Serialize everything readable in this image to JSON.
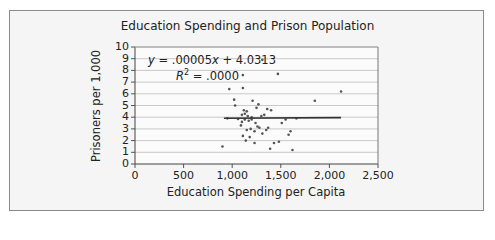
{
  "chart_data": {
    "type": "scatter",
    "title": "Education Spending and Prison Population",
    "xlabel": "Education Spending per Capita",
    "ylabel": "Prisoners per 1,000",
    "xlim": [
      0,
      2500
    ],
    "ylim": [
      0,
      10
    ],
    "x_ticks": [
      "0",
      "500",
      "1,000",
      "1,500",
      "2,000",
      "2,500"
    ],
    "y_ticks": [
      "0",
      "1",
      "2",
      "3",
      "4",
      "5",
      "6",
      "7",
      "8",
      "9",
      "10"
    ],
    "grid": "horizontal",
    "legend": "none",
    "trendline": {
      "equation": "y = .00005x + 4.0313",
      "r_squared": "R² = .0000",
      "slope": 5e-05,
      "intercept": 4.0313,
      "x_range": [
        915,
        2120
      ]
    },
    "points": [
      {
        "x": 900,
        "y": 1.5
      },
      {
        "x": 950,
        "y": 3.9
      },
      {
        "x": 970,
        "y": 6.4
      },
      {
        "x": 1020,
        "y": 5.5
      },
      {
        "x": 1030,
        "y": 5.0
      },
      {
        "x": 1060,
        "y": 3.85
      },
      {
        "x": 1090,
        "y": 3.3
      },
      {
        "x": 1100,
        "y": 4.2
      },
      {
        "x": 1100,
        "y": 3.6
      },
      {
        "x": 1110,
        "y": 6.5
      },
      {
        "x": 1110,
        "y": 7.6
      },
      {
        "x": 1110,
        "y": 2.4
      },
      {
        "x": 1120,
        "y": 4.6
      },
      {
        "x": 1130,
        "y": 4.3
      },
      {
        "x": 1130,
        "y": 3.8
      },
      {
        "x": 1140,
        "y": 2.0
      },
      {
        "x": 1150,
        "y": 2.9
      },
      {
        "x": 1150,
        "y": 4.5
      },
      {
        "x": 1160,
        "y": 4.1
      },
      {
        "x": 1170,
        "y": 3.7
      },
      {
        "x": 1180,
        "y": 2.3
      },
      {
        "x": 1190,
        "y": 3.0
      },
      {
        "x": 1200,
        "y": 3.8
      },
      {
        "x": 1200,
        "y": 4.0
      },
      {
        "x": 1210,
        "y": 5.4
      },
      {
        "x": 1230,
        "y": 1.8
      },
      {
        "x": 1230,
        "y": 2.8
      },
      {
        "x": 1240,
        "y": 3.5
      },
      {
        "x": 1250,
        "y": 4.8
      },
      {
        "x": 1260,
        "y": 3.2
      },
      {
        "x": 1270,
        "y": 5.1
      },
      {
        "x": 1280,
        "y": 3.1
      },
      {
        "x": 1300,
        "y": 4.1
      },
      {
        "x": 1310,
        "y": 8.9
      },
      {
        "x": 1310,
        "y": 2.6
      },
      {
        "x": 1330,
        "y": 4.2
      },
      {
        "x": 1350,
        "y": 2.9
      },
      {
        "x": 1360,
        "y": 4.7
      },
      {
        "x": 1370,
        "y": 3.1
      },
      {
        "x": 1390,
        "y": 1.3
      },
      {
        "x": 1400,
        "y": 4.6
      },
      {
        "x": 1430,
        "y": 1.8
      },
      {
        "x": 1470,
        "y": 7.7
      },
      {
        "x": 1480,
        "y": 1.9
      },
      {
        "x": 1510,
        "y": 3.5
      },
      {
        "x": 1550,
        "y": 3.8
      },
      {
        "x": 1580,
        "y": 2.5
      },
      {
        "x": 1600,
        "y": 2.8
      },
      {
        "x": 1620,
        "y": 1.2
      },
      {
        "x": 1660,
        "y": 3.9
      },
      {
        "x": 1850,
        "y": 5.4
      },
      {
        "x": 2120,
        "y": 6.2
      }
    ]
  }
}
